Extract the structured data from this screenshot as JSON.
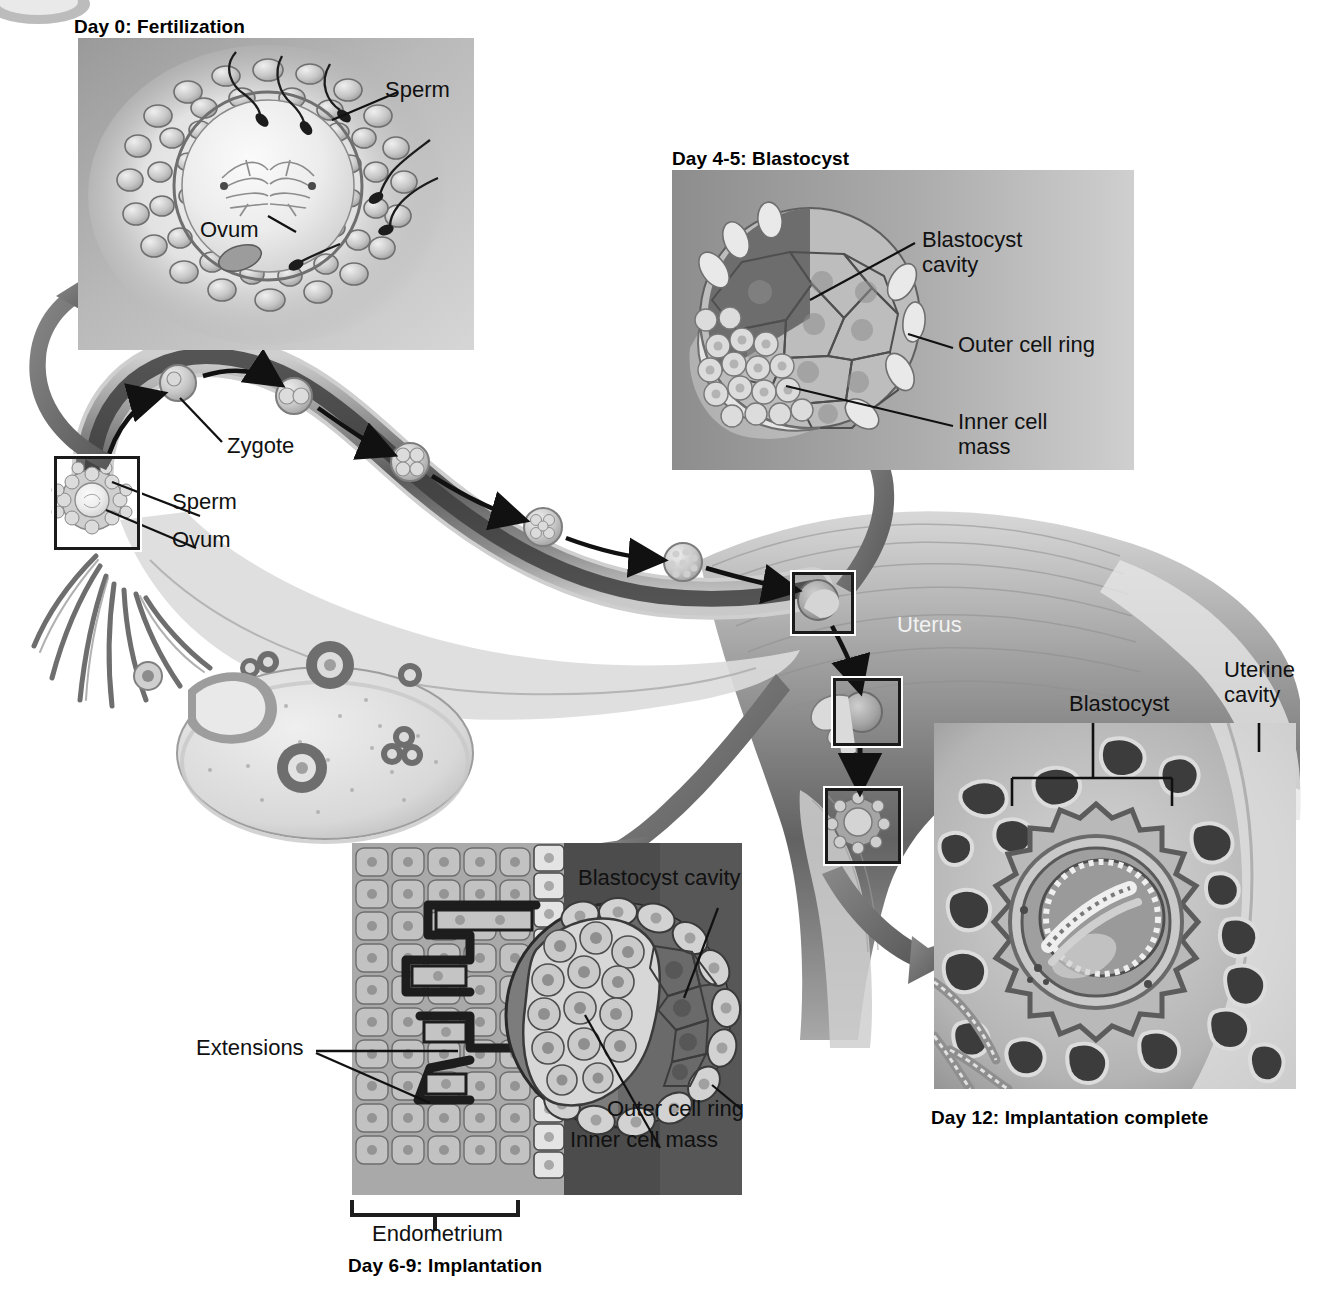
{
  "figure": {
    "type": "medical-illustration"
  },
  "panels": [
    {
      "id": "day0",
      "caption": "Day 0: Fertilization",
      "labels": [
        {
          "name": "sperm",
          "text": "Sperm"
        },
        {
          "name": "ovum",
          "text": "Ovum"
        }
      ]
    },
    {
      "id": "day45",
      "caption": "Day 4-5: Blastocyst",
      "labels": [
        {
          "name": "blastocyst-cavity",
          "text": "Blastocyst",
          "text2": "cavity"
        },
        {
          "name": "outer-cell-ring",
          "text": "Outer cell ring"
        },
        {
          "name": "inner-cell-mass",
          "text": "Inner cell",
          "text2": "mass"
        }
      ]
    },
    {
      "id": "day69",
      "caption": "Day 6-9: Implantation",
      "labels": [
        {
          "name": "blastocyst-cavity",
          "text": "Blastocyst cavity"
        },
        {
          "name": "extensions",
          "text": "Extensions"
        },
        {
          "name": "outer-cell-ring",
          "text": "Outer cell ring"
        },
        {
          "name": "inner-cell-mass",
          "text": "Inner cell mass"
        },
        {
          "name": "endometrium",
          "text": "Endometrium"
        }
      ]
    },
    {
      "id": "day12",
      "caption": "Day 12: Implantation complete",
      "labels": [
        {
          "name": "blastocyst",
          "text": "Blastocyst"
        },
        {
          "name": "uterine-cavity",
          "text": "Uterine",
          "text2": "cavity"
        }
      ]
    }
  ],
  "overview": {
    "labels": [
      {
        "name": "zygote",
        "text": "Zygote"
      },
      {
        "name": "sperm",
        "text": "Sperm"
      },
      {
        "name": "ovum",
        "text": "Ovum"
      },
      {
        "name": "uterus",
        "text": "Uterus"
      }
    ]
  },
  "colors": {
    "ink": "#111111",
    "panel_light": "#d9d9d9",
    "panel_mid": "#b6b6b6",
    "panel_dark": "#6f6f6f",
    "tube_dark": "#4a4a4a",
    "arrow_gray": "#707070",
    "white_text": "#f2f2f2"
  }
}
